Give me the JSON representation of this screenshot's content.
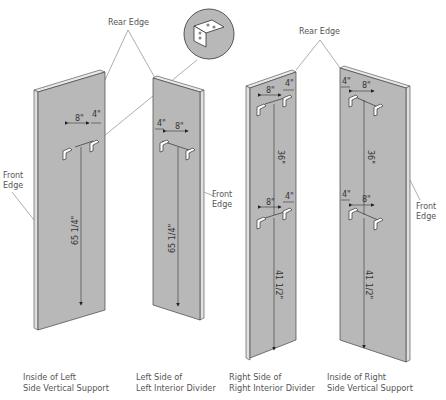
{
  "labels": {
    "rear_edge_left": "Rear Edge",
    "rear_edge_right": "Rear Edge",
    "front_edge_1": [
      "Front",
      "Edge"
    ],
    "front_edge_2": [
      "Front",
      "Edge"
    ],
    "front_edge_4": [
      "Front",
      "Edge"
    ]
  },
  "inset": {
    "name": "bracket-detail",
    "description": "L-bracket close-up"
  },
  "panels": [
    {
      "id": "inside-left-side-vertical-support",
      "caption": [
        "Inside of Left",
        "Side Vertical Support"
      ],
      "dims": {
        "spacing_a": "8\"",
        "spacing_b": "4\"",
        "height": "65 1/4\""
      }
    },
    {
      "id": "left-side-left-interior-divider",
      "caption": [
        "Left Side of",
        "Left Interior Divider"
      ],
      "dims": {
        "spacing_a": "4\"",
        "spacing_b": "8\"",
        "height": "65 1/4\""
      }
    },
    {
      "id": "right-side-right-interior-divider",
      "caption": [
        "Right Side of",
        "Right Interior Divider"
      ],
      "dims": {
        "top_a": "8\"",
        "top_b": "4\"",
        "mid": "36\"",
        "low_a": "8\"",
        "low_b": "4\"",
        "height": "41 1/2\""
      }
    },
    {
      "id": "inside-right-side-vertical-support",
      "caption": [
        "Inside of Right",
        "Side Vertical Support"
      ],
      "dims": {
        "top_a": "4\"",
        "top_b": "8\"",
        "mid": "36\"",
        "low_a": "4\"",
        "low_b": "8\"",
        "height": "41 1/2\""
      }
    }
  ],
  "colors": {
    "panel": "#b8b8b8",
    "edge": "#e8e8e8",
    "line": "#444444"
  }
}
